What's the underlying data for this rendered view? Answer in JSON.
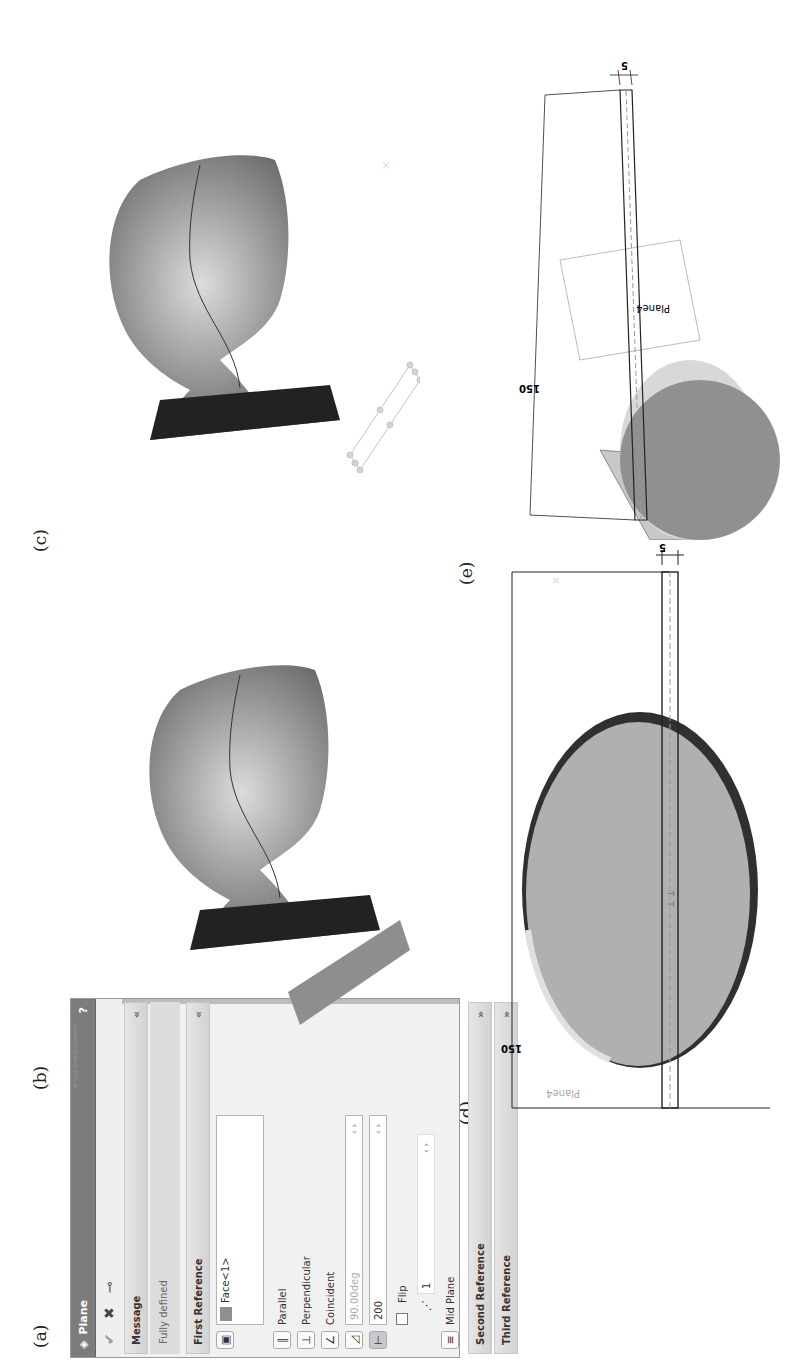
{
  "figure_labels": {
    "a": "(a)",
    "b": "(b)",
    "c": "(c)",
    "d": "(d)",
    "e": "(e)"
  },
  "property_manager": {
    "title": "Plane",
    "help_icon": "?",
    "toolbar": {
      "ok_icon": "check-icon",
      "cancel_icon": "close-icon",
      "pin_icon": "pushpin-icon"
    },
    "message": {
      "header": "Message",
      "text": "Fully defined",
      "collapse_icon": "«"
    },
    "first_reference": {
      "header": "First Reference",
      "collapse_icon": "«",
      "selection": "Face<1>",
      "constraints": [
        {
          "icon": "parallel-icon",
          "glyph": "∥",
          "label": "Parallel"
        },
        {
          "icon": "perpendicular-icon",
          "glyph": "⊥",
          "label": "Perpendicular"
        },
        {
          "icon": "coincident-icon",
          "glyph": "∠",
          "label": "Coincident"
        }
      ],
      "angle_value": "90.00deg",
      "offset_value": "200",
      "flip_label": "Flip",
      "flip_checked": false,
      "instances_value": "1",
      "mid_plane_label": "Mid Plane"
    },
    "second_reference": {
      "header": "Second Reference",
      "expand_icon": "»"
    },
    "third_reference": {
      "header": "Third Reference",
      "expand_icon": "»"
    }
  },
  "panel_b": {
    "tree_caption": "Chair Default<Default>"
  },
  "panel_d": {
    "dimension_length": "150",
    "dimension_thickness": "5",
    "plane_label": "Plane4"
  },
  "panel_e": {
    "dimension_length": "150",
    "dimension_thickness": "5",
    "plane_label": "Plane4"
  }
}
